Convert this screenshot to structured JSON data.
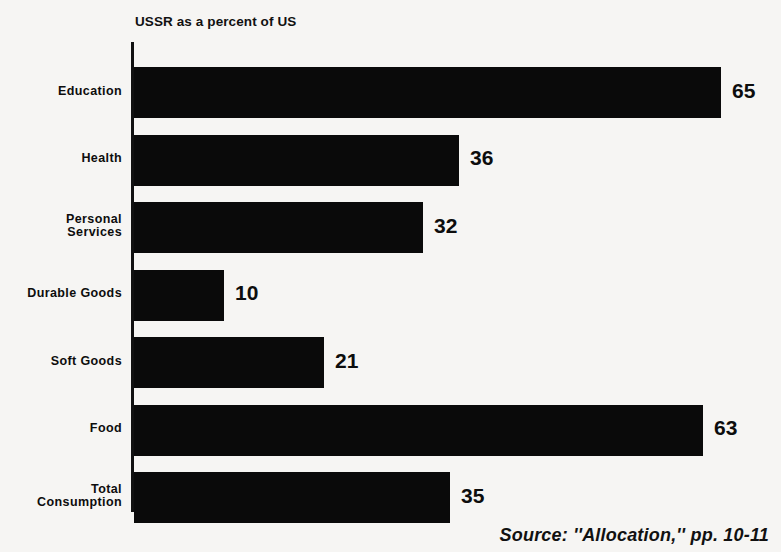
{
  "chart_data": {
    "type": "bar",
    "orientation": "horizontal",
    "title": "USSR as a percent of US",
    "xlabel": "",
    "ylabel": "",
    "xlim": [
      0,
      65
    ],
    "grid": false,
    "legend": null,
    "categories": [
      "Education",
      "Health",
      "Personal\nServices",
      "Durable Goods",
      "Soft Goods",
      "Food",
      "Total\nConsumption"
    ],
    "values": [
      65,
      36,
      32,
      10,
      21,
      63,
      35
    ],
    "value_labels": [
      "65",
      "36",
      "32",
      "10",
      "21",
      "63",
      "35"
    ],
    "bars": [
      {
        "label_line1": "Education",
        "label_line2": "",
        "value": 65,
        "value_label": "65"
      },
      {
        "label_line1": "Health",
        "label_line2": "",
        "value": 36,
        "value_label": "36"
      },
      {
        "label_line1": "Personal",
        "label_line2": "Services",
        "value": 32,
        "value_label": "32"
      },
      {
        "label_line1": "Durable Goods",
        "label_line2": "",
        "value": 10,
        "value_label": "10"
      },
      {
        "label_line1": "Soft Goods",
        "label_line2": "",
        "value": 21,
        "value_label": "21"
      },
      {
        "label_line1": "Food",
        "label_line2": "",
        "value": 63,
        "value_label": "63"
      },
      {
        "label_line1": "Total",
        "label_line2": "Consumption",
        "value": 35,
        "value_label": "35"
      }
    ],
    "colors": {
      "bar": "#0a0a0a",
      "axis": "#111111",
      "text": "#0d0d0d",
      "background": "#f6f5f3"
    }
  },
  "source": {
    "text": "Source: ''Allocation,'' pp. 10-11"
  }
}
